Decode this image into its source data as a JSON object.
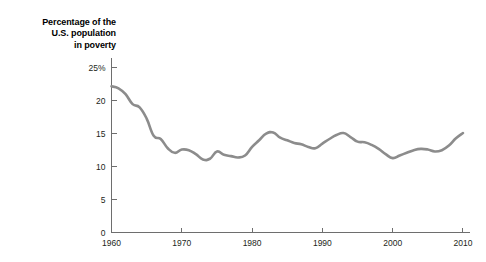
{
  "chart_data": {
    "type": "line",
    "title": "Percentage of the\nU.S. population\nin poverty",
    "xlabel": "",
    "ylabel": "",
    "xlim": [
      1960,
      2011
    ],
    "ylim": [
      0,
      26.5
    ],
    "grid": false,
    "legend": null,
    "series_color": "#8c8c8c",
    "axis_color": "#6e6e6e",
    "y_ticks": [
      0,
      5,
      10,
      15,
      20,
      25
    ],
    "y_tick_labels": [
      "0",
      "5",
      "10",
      "15",
      "20",
      "25%"
    ],
    "x_ticks": [
      1960,
      1970,
      1980,
      1990,
      2000,
      2010
    ],
    "x_tick_labels": [
      "1960",
      "1970",
      "1980",
      "1990",
      "2000",
      "2010"
    ],
    "series": [
      {
        "name": "Percentage of the U.S. population in poverty",
        "x": [
          1960,
          1961,
          1962,
          1963,
          1964,
          1965,
          1966,
          1967,
          1968,
          1969,
          1970,
          1971,
          1972,
          1973,
          1974,
          1975,
          1976,
          1977,
          1978,
          1979,
          1980,
          1981,
          1982,
          1983,
          1984,
          1985,
          1986,
          1987,
          1988,
          1989,
          1990,
          1991,
          1992,
          1993,
          1994,
          1995,
          1996,
          1997,
          1998,
          1999,
          2000,
          2001,
          2002,
          2003,
          2004,
          2005,
          2006,
          2007,
          2008,
          2009,
          2010
        ],
        "values": [
          22.2,
          21.9,
          21.0,
          19.5,
          19.0,
          17.3,
          14.7,
          14.2,
          12.8,
          12.1,
          12.6,
          12.5,
          11.9,
          11.1,
          11.2,
          12.3,
          11.8,
          11.6,
          11.4,
          11.7,
          13.0,
          14.0,
          15.0,
          15.2,
          14.4,
          14.0,
          13.6,
          13.4,
          13.0,
          12.8,
          13.5,
          14.2,
          14.8,
          15.1,
          14.5,
          13.8,
          13.7,
          13.3,
          12.7,
          11.9,
          11.3,
          11.7,
          12.1,
          12.5,
          12.7,
          12.6,
          12.3,
          12.5,
          13.2,
          14.3,
          15.1
        ]
      }
    ]
  }
}
